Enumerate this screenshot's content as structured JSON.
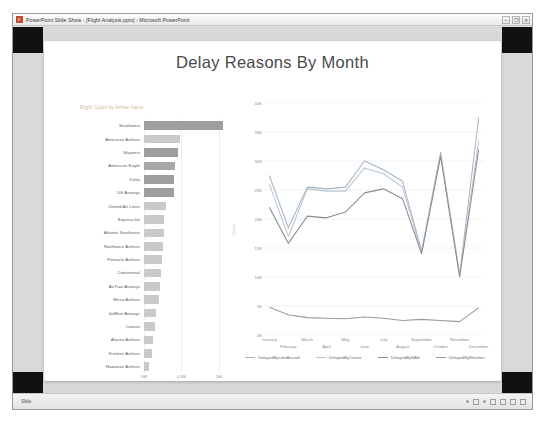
{
  "window": {
    "app_glyph": "P",
    "title": "PowerPoint Slide Show - [Flight Analysis.pptx] - Microsoft PowerPoint",
    "minimize_label": "–",
    "maximize_label": "❐",
    "close_label": "✕"
  },
  "slide": {
    "title": "Delay Reasons By Month"
  },
  "statusbar": {
    "text": "Slide"
  },
  "chart_data": [
    {
      "type": "bar",
      "title": "Flight Count by Airline Name",
      "orientation": "horizontal",
      "xlabel": "Flight Count",
      "ylabel": "",
      "xlim": [
        0,
        1150000
      ],
      "xticks": [
        "0M",
        "0.5M",
        "1M"
      ],
      "xtick_values": [
        0,
        500000,
        1000000
      ],
      "grid": true,
      "categories": [
        "Southwest",
        "American Airlines",
        "Skywest",
        "American Eagle",
        "Delta",
        "US Airways",
        "United Air Lines",
        "ExpressJet",
        "Atlantic Southeast",
        "Northwest Airlines",
        "Pinnacle Airlines",
        "Continental",
        "AirTran Airways",
        "Mesa Airlines",
        "JetBlue Airways",
        "Comair",
        "Alaska Airlines",
        "Frontier Airlines",
        "Hawaiian Airlines"
      ],
      "values": [
        1060000,
        480000,
        455000,
        410000,
        405000,
        400000,
        300000,
        270000,
        265000,
        255000,
        240000,
        225000,
        210000,
        195000,
        160000,
        150000,
        125000,
        105000,
        70000
      ],
      "bar_colors": [
        "#9e9e9e",
        "#c9c9c9",
        "#9e9e9e",
        "#a8a8a8",
        "#9e9e9e",
        "#9e9e9e",
        "#c9c9c9",
        "#c9c9c9",
        "#c9c9c9",
        "#c9c9c9",
        "#c9c9c9",
        "#c9c9c9",
        "#c9c9c9",
        "#c9c9c9",
        "#c9c9c9",
        "#c9c9c9",
        "#c9c9c9",
        "#c9c9c9",
        "#c9c9c9"
      ]
    },
    {
      "type": "line",
      "title": "",
      "xlabel": "",
      "ylabel": "Delays",
      "ylim": [
        0,
        40000
      ],
      "yticks": [
        "0K",
        "5K",
        "10K",
        "15K",
        "20K",
        "25K",
        "30K",
        "35K",
        "40K"
      ],
      "ytick_values": [
        0,
        5000,
        10000,
        15000,
        20000,
        25000,
        30000,
        35000,
        40000
      ],
      "grid": true,
      "legend_position": "bottom",
      "categories": [
        "January",
        "February",
        "March",
        "April",
        "May",
        "June",
        "July",
        "August",
        "September",
        "October",
        "November",
        "December"
      ],
      "series": [
        {
          "name": "DelayedByLateAircraft",
          "color": "#9fb3c8",
          "values": [
            27500,
            18500,
            25500,
            25200,
            25500,
            30000,
            28500,
            26500,
            14500,
            31500,
            10500,
            37500
          ]
        },
        {
          "name": "DelayedByCarrier",
          "color": "#b7c3cd",
          "values": [
            26000,
            17000,
            25200,
            24800,
            24800,
            28800,
            27800,
            25500,
            14200,
            31000,
            10200,
            33500
          ]
        },
        {
          "name": "DelayedByNAS",
          "color": "#8a8a8a",
          "values": [
            22000,
            15800,
            20500,
            20200,
            21200,
            24500,
            25200,
            23500,
            14000,
            30800,
            10000,
            32000
          ]
        },
        {
          "name": "DelayedByWeather",
          "color": "#9a9a9a",
          "values": [
            4800,
            3500,
            3000,
            2900,
            2800,
            3100,
            2900,
            2500,
            2700,
            2500,
            2300,
            4700
          ]
        }
      ]
    }
  ]
}
